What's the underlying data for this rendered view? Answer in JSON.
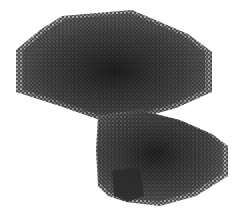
{
  "image": {
    "subject": "3D rendering of porous lattice structure",
    "background": "#ffffff",
    "colors": {
      "core": "#1c1c1c",
      "mid": "#3a3a3a",
      "edge": "#6a6a6a",
      "speckle": "#d8d8d8"
    },
    "regions": [
      {
        "name": "upper-block",
        "points": "62,16 132,10 160,22 188,34 212,52 212,92 176,108 140,118 100,120 60,106 16,92 16,50 40,30"
      },
      {
        "name": "lower-block",
        "points": "98,116 140,110 180,120 212,134 228,146 228,176 196,196 160,206 126,202 108,196 98,186 96,150"
      },
      {
        "name": "dark-pillar",
        "points": "112,170 140,168 144,196 128,202 114,196"
      }
    ]
  }
}
